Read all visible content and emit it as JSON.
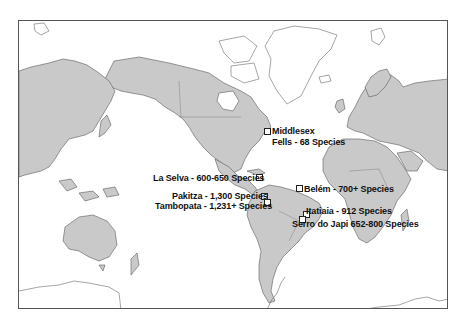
{
  "map": {
    "type": "world-map",
    "projection": "mercator",
    "land_color": "#c9c9c9",
    "ocean_color": "#ffffff",
    "sites": [
      {
        "name": "Middlesex Fells",
        "label_line1": "Middlesex",
        "label_line2": "Fells - 68 Species",
        "species": "68"
      },
      {
        "name": "La Selva",
        "label": "La Selva - 600-650 Species",
        "species": "600-650"
      },
      {
        "name": "Pakitza",
        "label": "Pakitza - 1,300 Species",
        "species": "1,300"
      },
      {
        "name": "Tambopata",
        "label": "Tambopata - 1,231+ Species",
        "species": "1,231+"
      },
      {
        "name": "Belém",
        "label": "Belém - 700+ Species",
        "species": "700+"
      },
      {
        "name": "Itatiaia",
        "label": "Itatiaia - 912 Species",
        "species": "912"
      },
      {
        "name": "Serro do Japi",
        "label": "Serro do Japi 652-800 Species",
        "species": "652-800"
      }
    ]
  }
}
